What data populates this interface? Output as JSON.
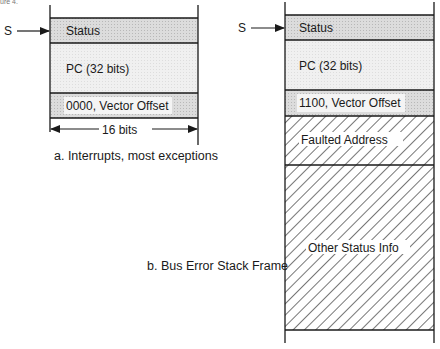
{
  "header_fragment": "ure 4.",
  "frame_a": {
    "pointer_label": "S",
    "rows": [
      {
        "label": "Status",
        "fill": "shaded"
      },
      {
        "label": "PC (32 bits)",
        "fill": "light"
      },
      {
        "label": "0000, Vector Offset",
        "fill": "shaded"
      }
    ],
    "width_label": "16 bits",
    "caption": "a. Interrupts, most exceptions"
  },
  "frame_b": {
    "pointer_label": "S",
    "rows": [
      {
        "label": "Status",
        "fill": "shaded"
      },
      {
        "label": "PC (32 bits)",
        "fill": "light"
      },
      {
        "label": "1100, Vector Offset",
        "fill": "shaded"
      },
      {
        "label": "Faulted Address",
        "fill": "hatched"
      },
      {
        "label": "Other Status Info",
        "fill": "hatched"
      }
    ],
    "caption": "b. Bus Error Stack Frame"
  },
  "colors": {
    "line": "#1a1a1a",
    "shaded": "#d6d6d6",
    "light": "#eeeeee",
    "label_bg": "#f4f4f4"
  }
}
